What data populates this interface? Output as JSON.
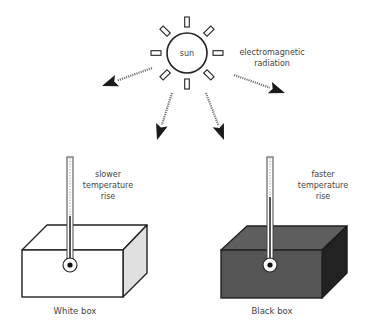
{
  "diagram": {
    "type": "experiment-illustration",
    "sun": {
      "label": "sun",
      "ray_count": 8
    },
    "radiation_label": [
      "electromagnetic",
      "radiation"
    ],
    "arrows": [
      {
        "name": "radiation-arrow-left",
        "direction": "down-left"
      },
      {
        "name": "radiation-arrow-right",
        "direction": "down-right"
      },
      {
        "name": "radiation-arrow-to-white-box",
        "direction": "down"
      },
      {
        "name": "radiation-arrow-to-black-box",
        "direction": "down"
      }
    ],
    "white_box": {
      "caption": "White box",
      "note": [
        "slower",
        "temperature",
        "rise"
      ],
      "front_color": "#ffffff",
      "top_color": "#ffffff",
      "side_color": "#e0e0e0"
    },
    "black_box": {
      "caption": "Black box",
      "note": [
        "faster",
        "temperature",
        "rise"
      ],
      "front_color": "#555555",
      "top_color": "#5e5e5e",
      "side_color": "#222222"
    },
    "colors": {
      "stroke": "#222222",
      "text": "#444444",
      "arrow_shaft": "#777777"
    }
  }
}
